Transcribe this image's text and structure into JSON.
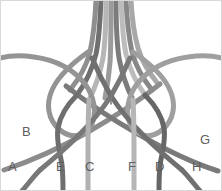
{
  "figure": {
    "background_color": "#ffffff",
    "border_color": "#d9d9d9",
    "width": 222,
    "height": 191
  },
  "labels": [
    {
      "text": "A",
      "x": 8,
      "y": 166
    },
    {
      "text": "B",
      "x": 22,
      "y": 131
    },
    {
      "text": "E",
      "x": 56,
      "y": 166
    },
    {
      "text": "C",
      "x": 85,
      "y": 166
    },
    {
      "text": "I",
      "x": 108,
      "y": 94
    },
    {
      "text": "F",
      "x": 128,
      "y": 166
    },
    {
      "text": "D",
      "x": 155,
      "y": 166
    },
    {
      "text": "H",
      "x": 192,
      "y": 166
    },
    {
      "text": "G",
      "x": 200,
      "y": 140
    }
  ],
  "palette": {
    "dark_gray": "#6f6f6f",
    "mid_gray": "#8a8a8a",
    "light_gray": "#a6a6a6",
    "pale_gray": "#bdbdbd",
    "very_pale_gray": "#cfcfcf"
  },
  "strands": [
    {
      "name": "strand-a",
      "label": "A",
      "color": "#9a9a9a",
      "width": 5
    },
    {
      "name": "strand-b",
      "label": "B",
      "color": "#8d8d8d",
      "width": 5
    },
    {
      "name": "strand-c",
      "label": "C",
      "color": "#b0b0b0",
      "width": 5
    },
    {
      "name": "strand-d",
      "label": "D",
      "color": "#6e6e6e",
      "width": 5
    },
    {
      "name": "strand-e",
      "label": "E",
      "color": "#7a7a7a",
      "width": 5
    },
    {
      "name": "strand-f",
      "label": "F",
      "color": "#b4b4b4",
      "width": 5
    },
    {
      "name": "strand-g",
      "label": "G",
      "color": "#a0a0a0",
      "width": 5
    },
    {
      "name": "strand-h",
      "label": "H",
      "color": "#747474",
      "width": 5
    },
    {
      "name": "strand-i",
      "label": "I",
      "color": "#7d7d7d",
      "width": 2
    }
  ]
}
